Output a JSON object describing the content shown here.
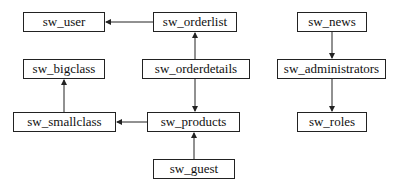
{
  "diagram": {
    "type": "table-relationship-diagram",
    "nodes": [
      {
        "id": "sw_user",
        "label": "sw_user",
        "x": 23,
        "y": 12,
        "w": 82,
        "h": 20
      },
      {
        "id": "sw_orderlist",
        "label": "sw_orderlist",
        "x": 153,
        "y": 12,
        "w": 84,
        "h": 20
      },
      {
        "id": "sw_bigclass",
        "label": "sw_bigclass",
        "x": 23,
        "y": 59,
        "w": 82,
        "h": 20
      },
      {
        "id": "sw_orderdetails",
        "label": "sw_orderdetails",
        "x": 142,
        "y": 59,
        "w": 108,
        "h": 20
      },
      {
        "id": "sw_smallclass",
        "label": "sw_smallclass",
        "x": 13,
        "y": 112,
        "w": 103,
        "h": 20
      },
      {
        "id": "sw_products",
        "label": "sw_products",
        "x": 147,
        "y": 112,
        "w": 93,
        "h": 20
      },
      {
        "id": "sw_guest",
        "label": "sw_guest",
        "x": 153,
        "y": 159,
        "w": 82,
        "h": 20
      },
      {
        "id": "sw_news",
        "label": "sw_news",
        "x": 297,
        "y": 12,
        "w": 70,
        "h": 20
      },
      {
        "id": "sw_administrators",
        "label": "sw_administrators",
        "x": 277,
        "y": 59,
        "w": 109,
        "h": 20
      },
      {
        "id": "sw_roles",
        "label": "sw_roles",
        "x": 297,
        "y": 112,
        "w": 70,
        "h": 20
      }
    ],
    "edges": [
      {
        "from": "sw_orderlist",
        "to": "sw_user"
      },
      {
        "from": "sw_orderdetails",
        "to": "sw_orderlist"
      },
      {
        "from": "sw_orderdetails",
        "to": "sw_products"
      },
      {
        "from": "sw_products",
        "to": "sw_smallclass"
      },
      {
        "from": "sw_smallclass",
        "to": "sw_bigclass"
      },
      {
        "from": "sw_guest",
        "to": "sw_products"
      },
      {
        "from": "sw_news",
        "to": "sw_administrators"
      },
      {
        "from": "sw_administrators",
        "to": "sw_roles"
      }
    ]
  },
  "labels": {
    "sw_user": "sw_user",
    "sw_orderlist": "sw_orderlist",
    "sw_bigclass": "sw_bigclass",
    "sw_orderdetails": "sw_orderdetails",
    "sw_smallclass": "sw_smallclass",
    "sw_products": "sw_products",
    "sw_guest": "sw_guest",
    "sw_news": "sw_news",
    "sw_administrators": "sw_administrators",
    "sw_roles": "sw_roles"
  },
  "colors": {
    "line": "#222222",
    "background": "#ffffff"
  }
}
